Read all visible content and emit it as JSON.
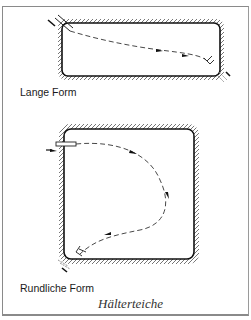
{
  "figure": {
    "title": "Hälterteiche",
    "panels": [
      {
        "label": "Lange Form",
        "shape": "long-rectangle",
        "inlet": "top-left",
        "outlet": "bottom-right",
        "flow": "diagonal dashed line with arrows from inlet to outlet"
      },
      {
        "label": "Rundliche Form",
        "shape": "rounded-square",
        "inlet": "top-left",
        "outlet": "bottom-left",
        "flow": "curved dashed loop with arrows from inlet to outlet"
      }
    ]
  },
  "colors": {
    "ink": "#1a1a1a",
    "frame": "#8a8a8a",
    "background": "#ffffff"
  }
}
